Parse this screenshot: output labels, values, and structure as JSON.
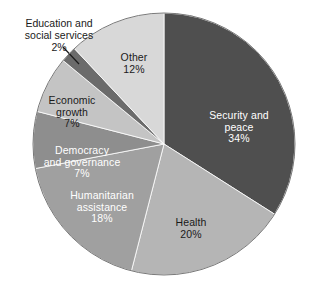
{
  "chart_data": {
    "type": "pie",
    "title": "",
    "subtitle": "",
    "xlabel": "",
    "ylabel": "",
    "legend_position": "none",
    "grid": false,
    "labels_inside": true,
    "units": "percent",
    "total": 100,
    "categories": [
      "Security and peace",
      "Health",
      "Humanitarian assistance",
      "Democracy and governance",
      "Economic growth",
      "Education and social services",
      "Other"
    ],
    "values": [
      34,
      20,
      18,
      7,
      7,
      2,
      12
    ],
    "colors": [
      "#4f4f4f",
      "#b5b5b5",
      "#a0a0a0",
      "#8e8e8e",
      "#c4c4c4",
      "#6b6b6b",
      "#d8d8d8"
    ],
    "slices": [
      {
        "name": "Security and peace",
        "label": "Security and\npeace",
        "value": 34,
        "percent_text": "34%",
        "color": "#4f4f4f",
        "text_color": "#ffffff",
        "label_placement": "inside"
      },
      {
        "name": "Health",
        "label": "Health",
        "value": 20,
        "percent_text": "20%",
        "color": "#b5b5b5",
        "text_color": "#1a1a1a",
        "label_placement": "inside"
      },
      {
        "name": "Humanitarian assistance",
        "label": "Humanitarian\nassistance",
        "value": 18,
        "percent_text": "18%",
        "color": "#a0a0a0",
        "text_color": "#ffffff",
        "label_placement": "inside"
      },
      {
        "name": "Democracy and governance",
        "label": "Democracy\nand governance",
        "value": 7,
        "percent_text": "7%",
        "color": "#8e8e8e",
        "text_color": "#ffffff",
        "label_placement": "inside"
      },
      {
        "name": "Economic growth",
        "label": "Economic\ngrowth",
        "value": 7,
        "percent_text": "7%",
        "color": "#c4c4c4",
        "text_color": "#1a1a1a",
        "label_placement": "inside"
      },
      {
        "name": "Education and social services",
        "label": "Education and\nsocial services",
        "value": 2,
        "percent_text": "2%",
        "color": "#6b6b6b",
        "text_color": "#1a1a1a",
        "label_placement": "outside-with-leader"
      },
      {
        "name": "Other",
        "label": "Other",
        "value": 12,
        "percent_text": "12%",
        "color": "#d8d8d8",
        "text_color": "#1a1a1a",
        "label_placement": "inside"
      }
    ],
    "geometry": {
      "center_x": 164,
      "center_y": 144,
      "radius": 131,
      "start_angle_deg": 0,
      "direction": "clockwise"
    },
    "background_color": "#ffffff",
    "outline_color": "#7a7a7a"
  }
}
